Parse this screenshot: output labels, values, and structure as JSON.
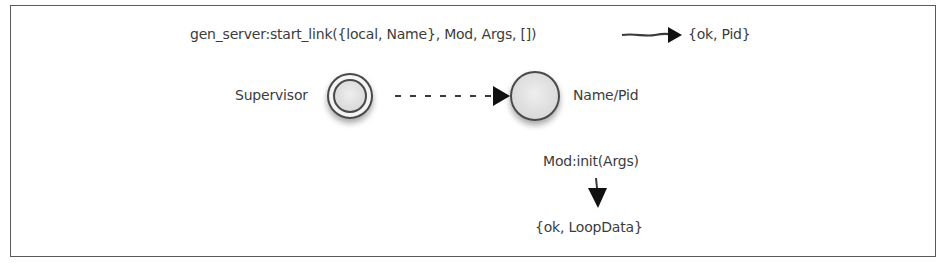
{
  "diagram": {
    "top_call": {
      "expression": "gen_server:start_link({local, Name}, Mod, Args, [])",
      "result": "{ok, Pid}"
    },
    "nodes": {
      "supervisor": {
        "label": "Supervisor",
        "shape": "double-circle"
      },
      "worker": {
        "label": "Name/Pid",
        "shape": "circle"
      }
    },
    "edges": [
      {
        "from": "supervisor",
        "to": "worker",
        "style": "dashed",
        "label": ""
      },
      {
        "from": "top_call.expression",
        "to": "top_call.result",
        "style": "solid",
        "label": ""
      },
      {
        "from": "init_call",
        "to": "init_result",
        "style": "solid",
        "label": ""
      }
    ],
    "init_call": "Mod:init(Args)",
    "init_result": "{ok, LoopData}",
    "colors": {
      "stroke": "#3a3a3a",
      "node_fill": "#e6e6e6",
      "arrow": "#111111",
      "frame": "#5a5a5a"
    }
  }
}
